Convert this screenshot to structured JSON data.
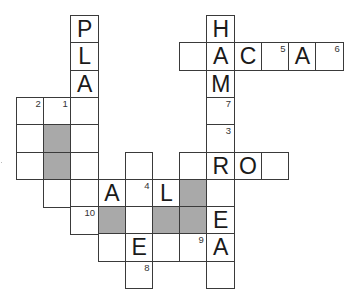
{
  "puzzle": {
    "type": "crossword",
    "origin_x": 16,
    "origin_y": 15,
    "cell_width": 27.2,
    "cell_height": 27.3,
    "colors": {
      "line": "#3a3a3a",
      "shaded": "#a9a9a9",
      "blank": "#ffffff",
      "text": "#1a1a1a"
    }
  },
  "grid": {
    "cells": [
      {
        "row": 0,
        "col": 2,
        "letter": "P",
        "number": "",
        "shaded": false
      },
      {
        "row": 0,
        "col": 7,
        "letter": "H",
        "number": "",
        "shaded": false
      },
      {
        "row": 1,
        "col": 2,
        "letter": "L",
        "number": "",
        "shaded": false
      },
      {
        "row": 1,
        "col": 6,
        "letter": "",
        "number": "",
        "shaded": false
      },
      {
        "row": 1,
        "col": 7,
        "letter": "A",
        "number": "",
        "shaded": false
      },
      {
        "row": 1,
        "col": 8,
        "letter": "C",
        "number": "",
        "shaded": false
      },
      {
        "row": 1,
        "col": 9,
        "letter": "",
        "number": "5",
        "shaded": false
      },
      {
        "row": 1,
        "col": 10,
        "letter": "A",
        "number": "",
        "shaded": false
      },
      {
        "row": 1,
        "col": 11,
        "letter": "",
        "number": "6",
        "shaded": false
      },
      {
        "row": 2,
        "col": 2,
        "letter": "A",
        "number": "",
        "shaded": false
      },
      {
        "row": 2,
        "col": 7,
        "letter": "M",
        "number": "",
        "shaded": false
      },
      {
        "row": 3,
        "col": 0,
        "letter": "",
        "number": "2",
        "shaded": false
      },
      {
        "row": 3,
        "col": 1,
        "letter": "",
        "number": "1",
        "shaded": false
      },
      {
        "row": 3,
        "col": 2,
        "letter": "",
        "number": "",
        "shaded": false
      },
      {
        "row": 3,
        "col": 7,
        "letter": "",
        "number": "7",
        "shaded": false
      },
      {
        "row": 4,
        "col": 0,
        "letter": "",
        "number": "",
        "shaded": false
      },
      {
        "row": 4,
        "col": 1,
        "letter": "",
        "number": "",
        "shaded": true
      },
      {
        "row": 4,
        "col": 2,
        "letter": "",
        "number": "",
        "shaded": false
      },
      {
        "row": 4,
        "col": 7,
        "letter": "",
        "number": "3",
        "shaded": false
      },
      {
        "row": 5,
        "col": 0,
        "letter": "",
        "number": "",
        "shaded": false
      },
      {
        "row": 5,
        "col": 1,
        "letter": "",
        "number": "",
        "shaded": true
      },
      {
        "row": 5,
        "col": 2,
        "letter": "",
        "number": "",
        "shaded": false
      },
      {
        "row": 5,
        "col": 4,
        "letter": "",
        "number": "",
        "shaded": false
      },
      {
        "row": 5,
        "col": 6,
        "letter": "",
        "number": "",
        "shaded": false
      },
      {
        "row": 5,
        "col": 7,
        "letter": "R",
        "number": "",
        "shaded": false
      },
      {
        "row": 5,
        "col": 8,
        "letter": "O",
        "number": "",
        "shaded": false
      },
      {
        "row": 5,
        "col": 9,
        "letter": "",
        "number": "",
        "shaded": false
      },
      {
        "row": 6,
        "col": 1,
        "letter": "",
        "number": "",
        "shaded": false
      },
      {
        "row": 6,
        "col": 2,
        "letter": "",
        "number": "",
        "shaded": false
      },
      {
        "row": 6,
        "col": 3,
        "letter": "A",
        "number": "",
        "shaded": false
      },
      {
        "row": 6,
        "col": 4,
        "letter": "",
        "number": "4",
        "shaded": false
      },
      {
        "row": 6,
        "col": 5,
        "letter": "L",
        "number": "",
        "shaded": false
      },
      {
        "row": 6,
        "col": 6,
        "letter": "",
        "number": "",
        "shaded": true
      },
      {
        "row": 6,
        "col": 7,
        "letter": "",
        "number": "",
        "shaded": false
      },
      {
        "row": 7,
        "col": 2,
        "letter": "",
        "number": "10",
        "shaded": false
      },
      {
        "row": 7,
        "col": 3,
        "letter": "",
        "number": "",
        "shaded": true
      },
      {
        "row": 7,
        "col": 4,
        "letter": "",
        "number": "",
        "shaded": false
      },
      {
        "row": 7,
        "col": 5,
        "letter": "",
        "number": "",
        "shaded": true
      },
      {
        "row": 7,
        "col": 6,
        "letter": "",
        "number": "",
        "shaded": true
      },
      {
        "row": 7,
        "col": 7,
        "letter": "E",
        "number": "",
        "shaded": false
      },
      {
        "row": 8,
        "col": 3,
        "letter": "",
        "number": "",
        "shaded": false
      },
      {
        "row": 8,
        "col": 4,
        "letter": "E",
        "number": "",
        "shaded": false
      },
      {
        "row": 8,
        "col": 5,
        "letter": "",
        "number": "",
        "shaded": false
      },
      {
        "row": 8,
        "col": 6,
        "letter": "",
        "number": "9",
        "shaded": false
      },
      {
        "row": 8,
        "col": 7,
        "letter": "A",
        "number": "",
        "shaded": false
      },
      {
        "row": 9,
        "col": 4,
        "letter": "",
        "number": "8",
        "shaded": false
      },
      {
        "row": 9,
        "col": 7,
        "letter": "",
        "number": "",
        "shaded": false
      }
    ]
  }
}
